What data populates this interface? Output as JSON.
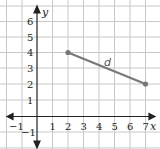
{
  "diagram": {
    "type": "coordinate-grid",
    "axes": {
      "x_label": "x",
      "y_label": "y",
      "x_ticks": [
        "−1",
        "1",
        "2",
        "3",
        "4",
        "5",
        "6",
        "7"
      ],
      "y_ticks": [
        "6",
        "5",
        "4",
        "3",
        "2",
        "1",
        "−1"
      ],
      "x_range": [
        -2,
        7.5
      ],
      "y_range": [
        -2,
        7
      ]
    },
    "segment": {
      "label": "d",
      "start": {
        "x": 2,
        "y": 4
      },
      "end": {
        "x": 7,
        "y": 2
      }
    },
    "colors": {
      "grid": "#c8c8c8",
      "axis": "#222222",
      "segment": "#777777",
      "point": "#777777"
    }
  }
}
